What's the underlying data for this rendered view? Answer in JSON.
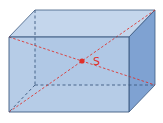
{
  "diagram": {
    "type": "cuboid-with-space-diagonals",
    "center_label": "S",
    "colors": {
      "background": "#ffffff",
      "front_face": "#a9c3e3",
      "top_face": "#c4d6ec",
      "right_face": "#7fa2d2",
      "edge": "#3d5a80",
      "hidden_edge": "#3d5a80",
      "diagonal": "#e0302a",
      "center_point": "#e0302a"
    },
    "vertices": {
      "front_top_left": [
        9,
        37
      ],
      "front_top_right": [
        129,
        37
      ],
      "front_bottom_right": [
        129,
        112
      ],
      "front_bottom_left": [
        9,
        112
      ],
      "back_top_left": [
        35,
        10
      ],
      "back_top_right": [
        155,
        10
      ],
      "back_bottom_right": [
        155,
        85
      ],
      "back_bottom_left": [
        35,
        85
      ]
    },
    "center_point": [
      82,
      61
    ]
  }
}
